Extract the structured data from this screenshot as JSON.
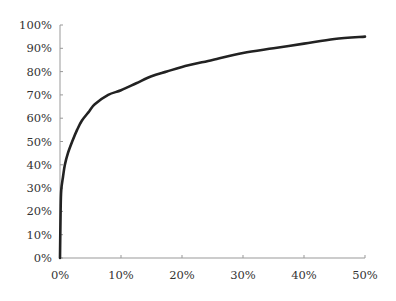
{
  "chart_data": {
    "type": "line",
    "title": "",
    "xlabel": "",
    "ylabel": "",
    "xlim": [
      0,
      50
    ],
    "ylim": [
      0,
      100
    ],
    "grid": false,
    "legend": null,
    "x_ticks": [
      "0%",
      "10%",
      "20%",
      "30%",
      "40%",
      "50%"
    ],
    "y_ticks": [
      "0%",
      "10%",
      "20%",
      "30%",
      "40%",
      "50%",
      "60%",
      "70%",
      "80%",
      "90%",
      "100%"
    ],
    "series": [
      {
        "name": "curve",
        "color": "#222222",
        "x": [
          0,
          0.1,
          0.2,
          0.5,
          0.8,
          1.3,
          2,
          2.8,
          3.6,
          4.8,
          5.7,
          7.9,
          10,
          12.5,
          15,
          17.5,
          20,
          25,
          30,
          35,
          40,
          45,
          50
        ],
        "y": [
          0,
          20,
          29,
          35,
          40,
          45,
          50,
          55,
          59,
          63,
          66,
          70,
          72,
          75,
          78,
          80,
          82,
          85,
          88,
          90,
          92,
          94,
          95
        ]
      }
    ]
  },
  "colors": {
    "line": "#222222",
    "axis": "#999999",
    "text": "#333333",
    "background": "#ffffff"
  }
}
